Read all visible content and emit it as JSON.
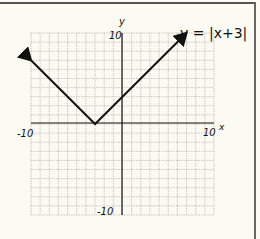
{
  "chart_data": {
    "type": "line",
    "title": "y = |x+3|",
    "equation_label": "y = |x+3|",
    "xlabel": "x",
    "ylabel": "y",
    "xlim": [
      -10,
      10
    ],
    "ylim": [
      -10,
      10
    ],
    "grid": true,
    "tick_labels": {
      "x_min": "-10",
      "x_max": "10",
      "y_min": "-10",
      "y_max": "10"
    },
    "series": [
      {
        "name": "y = |x+3|",
        "x": [
          -10,
          -3,
          7
        ],
        "y": [
          7,
          0,
          10
        ],
        "arrows": "both ends"
      }
    ],
    "vertex": [
      -3,
      0
    ]
  },
  "labels": {
    "equation": "y = |x+3|",
    "x_axis": "x",
    "y_axis": "y",
    "x_min": "-10",
    "x_max": "10",
    "y_min": "-10",
    "y_max": "10"
  },
  "colors": {
    "background": "#fcfbf3",
    "grid": "#9a9a9a",
    "axes": "#111111",
    "line": "#111111"
  }
}
